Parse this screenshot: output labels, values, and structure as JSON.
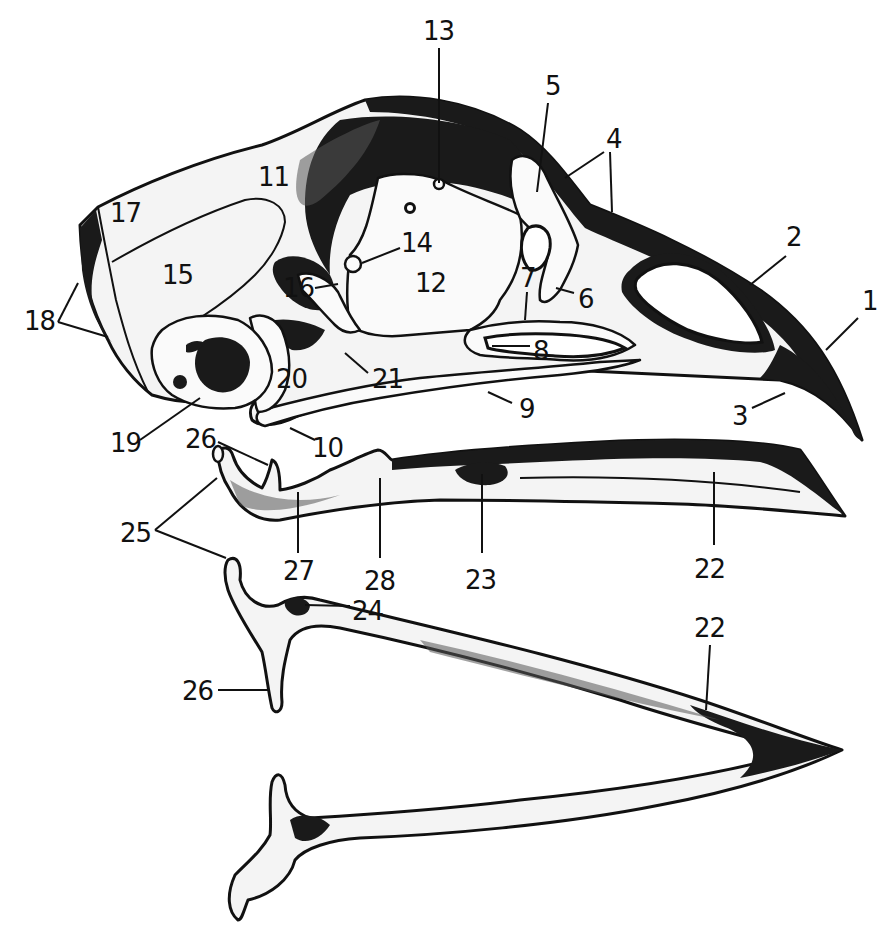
{
  "figure": {
    "colors": {
      "ink": "#111111",
      "paper": "#ffffff",
      "stipple": "#555555"
    },
    "labels": [
      {
        "id": "1",
        "text": "1",
        "x": 862,
        "y": 310,
        "leader": [
          [
            858,
            318
          ],
          [
            826,
            350
          ]
        ]
      },
      {
        "id": "2",
        "text": "2",
        "x": 786,
        "y": 246,
        "leader": [
          [
            786,
            256
          ],
          [
            750,
            285
          ]
        ]
      },
      {
        "id": "3",
        "text": "3",
        "x": 732,
        "y": 425,
        "leader": [
          [
            752,
            408
          ],
          [
            785,
            393
          ]
        ]
      },
      {
        "id": "4",
        "text": "4",
        "x": 606,
        "y": 148,
        "leader_a": [
          [
            604,
            152
          ],
          [
            565,
            178
          ]
        ],
        "leader_b": [
          [
            610,
            152
          ],
          [
            612,
            212
          ]
        ]
      },
      {
        "id": "5",
        "text": "5",
        "x": 545,
        "y": 95,
        "leader": [
          [
            548,
            103
          ],
          [
            537,
            192
          ]
        ]
      },
      {
        "id": "6",
        "text": "6",
        "x": 578,
        "y": 308,
        "leader": [
          [
            574,
            293
          ],
          [
            556,
            288
          ]
        ]
      },
      {
        "id": "7",
        "text": "7",
        "x": 520,
        "y": 287,
        "leader": [
          [
            527,
            292
          ],
          [
            525,
            320
          ]
        ]
      },
      {
        "id": "8",
        "text": "8",
        "x": 533,
        "y": 360,
        "leader": [
          [
            530,
            346
          ],
          [
            492,
            346
          ]
        ]
      },
      {
        "id": "9",
        "text": "9",
        "x": 519,
        "y": 418,
        "leader": [
          [
            512,
            403
          ],
          [
            488,
            392
          ]
        ]
      },
      {
        "id": "10",
        "text": "10",
        "x": 312,
        "y": 457,
        "leader": [
          [
            315,
            440
          ],
          [
            290,
            428
          ]
        ]
      },
      {
        "id": "11",
        "text": "11",
        "x": 258,
        "y": 186
      },
      {
        "id": "12",
        "text": "12",
        "x": 415,
        "y": 292
      },
      {
        "id": "13",
        "text": "13",
        "x": 423,
        "y": 40,
        "leader": [
          [
            439,
            48
          ],
          [
            439,
            183
          ]
        ]
      },
      {
        "id": "14",
        "text": "14",
        "x": 401,
        "y": 252,
        "leader": [
          [
            400,
            248
          ],
          [
            362,
            263
          ]
        ]
      },
      {
        "id": "15",
        "text": "15",
        "x": 162,
        "y": 284
      },
      {
        "id": "16",
        "text": "16",
        "x": 283,
        "y": 297,
        "leader": [
          [
            315,
            288
          ],
          [
            338,
            284
          ]
        ]
      },
      {
        "id": "17",
        "text": "17",
        "x": 110,
        "y": 222
      },
      {
        "id": "18",
        "text": "18",
        "x": 24,
        "y": 330,
        "leader_a": [
          [
            58,
            322
          ],
          [
            78,
            283
          ]
        ],
        "leader_b": [
          [
            58,
            322
          ],
          [
            108,
            337
          ]
        ]
      },
      {
        "id": "19",
        "text": "19",
        "x": 110,
        "y": 452,
        "leader": [
          [
            140,
            440
          ],
          [
            200,
            398
          ]
        ]
      },
      {
        "id": "20",
        "text": "20",
        "x": 276,
        "y": 388
      },
      {
        "id": "21",
        "text": "21",
        "x": 372,
        "y": 388,
        "leader": [
          [
            368,
            373
          ],
          [
            345,
            353
          ]
        ]
      },
      {
        "id": "22",
        "text": "22",
        "x": 694,
        "y": 578,
        "leader": [
          [
            714,
            545
          ],
          [
            714,
            472
          ]
        ]
      },
      {
        "id": "22b",
        "text": "22",
        "x": 694,
        "y": 637,
        "leader": [
          [
            710,
            645
          ],
          [
            706,
            710
          ]
        ]
      },
      {
        "id": "23",
        "text": "23",
        "x": 465,
        "y": 589,
        "leader": [
          [
            482,
            553
          ],
          [
            482,
            474
          ]
        ]
      },
      {
        "id": "24",
        "text": "24",
        "x": 352,
        "y": 620,
        "leader": [
          [
            350,
            606
          ],
          [
            305,
            605
          ]
        ]
      },
      {
        "id": "25",
        "text": "25",
        "x": 120,
        "y": 542,
        "leader_a": [
          [
            155,
            530
          ],
          [
            217,
            478
          ]
        ],
        "leader_b": [
          [
            155,
            530
          ],
          [
            226,
            558
          ]
        ]
      },
      {
        "id": "26",
        "text": "26",
        "x": 185,
        "y": 448,
        "leader": [
          [
            218,
            442
          ],
          [
            268,
            465
          ]
        ]
      },
      {
        "id": "26b",
        "text": "26",
        "x": 182,
        "y": 700,
        "leader": [
          [
            218,
            690
          ],
          [
            268,
            690
          ]
        ]
      },
      {
        "id": "27",
        "text": "27",
        "x": 283,
        "y": 580,
        "leader": [
          [
            298,
            553
          ],
          [
            298,
            492
          ]
        ]
      },
      {
        "id": "28",
        "text": "28",
        "x": 364,
        "y": 590,
        "leader": [
          [
            380,
            558
          ],
          [
            380,
            478
          ]
        ]
      }
    ]
  }
}
